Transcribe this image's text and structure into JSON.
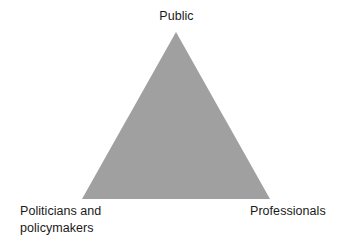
{
  "canvas": {
    "width": 351,
    "height": 247,
    "background_color": "#ffffff"
  },
  "diagram": {
    "type": "triangle",
    "title": "",
    "shape": {
      "name": "stakeholder-triangle",
      "fill_color": "#a0a0a0",
      "stroke_color": "none",
      "vertices": {
        "top": {
          "x": 176,
          "y": 32
        },
        "bottom_left": {
          "x": 82,
          "y": 199
        },
        "bottom_right": {
          "x": 270,
          "y": 199
        }
      }
    },
    "labels": {
      "top": {
        "text": "Public",
        "position": "top-apex",
        "color": "#1a1a1a"
      },
      "bottom_left": {
        "lines": [
          "Politicians and",
          "policymakers"
        ],
        "position": "bottom-left-vertex",
        "color": "#1a1a1a"
      },
      "bottom_right": {
        "text": "Professionals",
        "position": "bottom-right-vertex",
        "color": "#1a1a1a"
      }
    }
  }
}
